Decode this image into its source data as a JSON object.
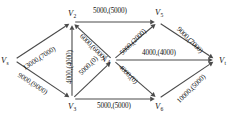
{
  "figure": {
    "kind": "network-flow-graph",
    "edge_label_format": "capacity,(flow)"
  },
  "colors": {
    "edge": "#4a4a4a",
    "text": "#121212",
    "background": "#ffffff"
  },
  "nodes": [
    {
      "id": "vs",
      "label": "V",
      "sub": "s",
      "x": 14,
      "y": 60
    },
    {
      "id": "v2",
      "label": "V",
      "sub": "2",
      "x": 72,
      "y": 22
    },
    {
      "id": "v3",
      "label": "V",
      "sub": "3",
      "x": 72,
      "y": 99
    },
    {
      "id": "v4",
      "label": "V",
      "sub": "4",
      "x": 113,
      "y": 60
    },
    {
      "id": "v5",
      "label": "V",
      "sub": "5",
      "x": 158,
      "y": 22
    },
    {
      "id": "v6",
      "label": "V",
      "sub": "6",
      "x": 158,
      "y": 99
    },
    {
      "id": "vt",
      "label": "V",
      "sub": "t",
      "x": 216,
      "y": 60
    }
  ],
  "edges": [
    {
      "id": "vs-v2",
      "from": "vs",
      "to": "v2",
      "capacity": 13000,
      "flow": 7000,
      "label": "13000,(7000)"
    },
    {
      "id": "vs-v3",
      "from": "vs",
      "to": "v3",
      "capacity": 9000,
      "flow": 9000,
      "label": "9000,(9000)"
    },
    {
      "id": "v3-v2",
      "from": "v3",
      "to": "v2",
      "capacity": 4000,
      "flow": 4000,
      "label": "4000,(4000)"
    },
    {
      "id": "v2-v5",
      "from": "v2",
      "to": "v5",
      "capacity": 5000,
      "flow": 5000,
      "label": "5000,(5000)"
    },
    {
      "id": "v4-v2",
      "from": "v4",
      "to": "v2",
      "capacity": 6000,
      "flow": 6000,
      "label": "6000,(6000)"
    },
    {
      "id": "v3-v4",
      "from": "v3",
      "to": "v4",
      "capacity": 5000,
      "flow": 0,
      "label": "5000,(0)"
    },
    {
      "id": "v4-v5",
      "from": "v4",
      "to": "v5",
      "capacity": 5000,
      "flow": 2000,
      "label": "5000,(2000)"
    },
    {
      "id": "v4-vt",
      "from": "v4",
      "to": "vt",
      "capacity": 4000,
      "flow": 4000,
      "label": "4000,(4000)"
    },
    {
      "id": "v4-v6",
      "from": "v4",
      "to": "v6",
      "capacity": 4000,
      "flow": 0,
      "label": "4000,(0)"
    },
    {
      "id": "v3-v6",
      "from": "v3",
      "to": "v6",
      "capacity": 5000,
      "flow": 5000,
      "label": "5000,(5000)"
    },
    {
      "id": "v5-vt",
      "from": "v5",
      "to": "vt",
      "capacity": 9000,
      "flow": 7000,
      "label": "9000,(7000)"
    },
    {
      "id": "v6-vt",
      "from": "v6",
      "to": "vt",
      "capacity": 10000,
      "flow": 5000,
      "label": "10000,(5000)"
    }
  ],
  "label_positions": {
    "vs-v2": {
      "x": 22,
      "y": 66,
      "rot": -33
    },
    "vs-v3": {
      "x": 20,
      "y": 72,
      "rot": 33
    },
    "v3-v2": {
      "x": 67,
      "y": 84,
      "rot": -90
    },
    "v2-v5": {
      "x": 93,
      "y": 8,
      "rot": 0
    },
    "v4-v2": {
      "x": 83,
      "y": 33,
      "rot": 45
    },
    "v3-v4": {
      "x": 78,
      "y": 72,
      "rot": -45
    },
    "v4-v5": {
      "x": 119,
      "y": 52,
      "rot": -45
    },
    "v4-vt": {
      "x": 142,
      "y": 50,
      "rot": 0
    },
    "v4-v6": {
      "x": 122,
      "y": 64,
      "rot": 45
    },
    "v3-v6": {
      "x": 97,
      "y": 103,
      "rot": 0
    },
    "v5-vt": {
      "x": 180,
      "y": 26,
      "rot": 45
    },
    "v6-vt": {
      "x": 176,
      "y": 100,
      "rot": -45
    }
  },
  "vertex_label_offsets": {
    "vs": {
      "dx": -13,
      "dy": -4
    },
    "v2": {
      "dx": -4,
      "dy": -13
    },
    "v3": {
      "dx": -4,
      "dy": 3
    },
    "v4": {
      "dx": -11,
      "dy": -5
    },
    "v5": {
      "dx": -3,
      "dy": -14
    },
    "v6": {
      "dx": -3,
      "dy": 3
    },
    "vt": {
      "dx": 3,
      "dy": -4
    }
  }
}
